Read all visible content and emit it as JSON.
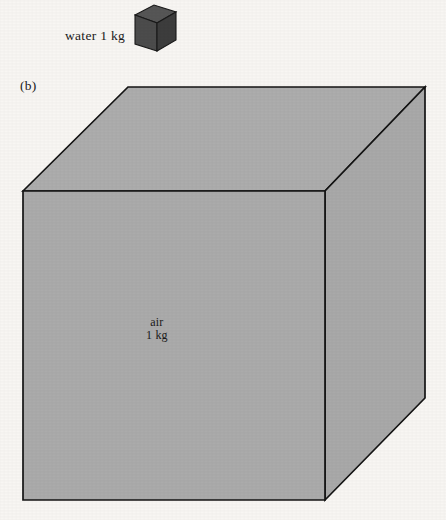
{
  "figure": {
    "panel_label": "(b)",
    "background_color": "#f8f6f3",
    "small_cube": {
      "name": "water-cube",
      "label": "water 1 kg",
      "face_color": "#4c4c4c",
      "top_color": "#565656",
      "side_color": "#3d3d3d",
      "outline_color": "#1a1a1a"
    },
    "large_cube": {
      "name": "air-cube",
      "label_line_1": "air",
      "label_line_2": "1 kg",
      "face_color": "#ababab",
      "top_color": "#adadad",
      "side_color": "#a9a9a9",
      "outline_color": "#141414"
    }
  }
}
